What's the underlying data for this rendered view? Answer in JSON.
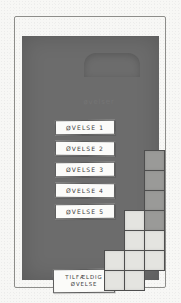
{
  "sketch": {
    "medium": "pencil-wireframe-on-paper",
    "paper_color": "#f7f7f5",
    "frame_border_color": "#8d8d8a"
  },
  "device": {
    "body_color": "#6c6c6c",
    "notch": {
      "name": "camera-bump",
      "shape": "rounded-tab"
    }
  },
  "screen": {
    "heading": "øvelser",
    "buttons": [
      {
        "label": "ØVELSE 1"
      },
      {
        "label": "ØVELSE 2"
      },
      {
        "label": "ØVELSE 3"
      },
      {
        "label": "ØVELSE 4"
      },
      {
        "label": "ØVELSE 5"
      }
    ],
    "random_button": {
      "line1": "TILFÆLDIG",
      "line2": "ØVELSE"
    },
    "button_fill": "#fbfbf9",
    "button_stroke": "#5d5d5d"
  },
  "tile_grid": {
    "cell_size": 21,
    "stroke": "#4e4e4e",
    "dark_fill": "#9a9a98",
    "light_fill": "#e4e4e0",
    "cells": [
      {
        "col": 2,
        "row": 0,
        "shade": "dark"
      },
      {
        "col": 2,
        "row": 1,
        "shade": "dark"
      },
      {
        "col": 2,
        "row": 2,
        "shade": "dark"
      },
      {
        "col": 2,
        "row": 3,
        "shade": "dark"
      },
      {
        "col": 1,
        "row": 3,
        "shade": "light"
      },
      {
        "col": 1,
        "row": 4,
        "shade": "light"
      },
      {
        "col": 2,
        "row": 4,
        "shade": "light"
      },
      {
        "col": 0,
        "row": 5,
        "shade": "light"
      },
      {
        "col": 1,
        "row": 5,
        "shade": "light"
      },
      {
        "col": 2,
        "row": 5,
        "shade": "light"
      },
      {
        "col": 0,
        "row": 6,
        "shade": "light"
      },
      {
        "col": 1,
        "row": 6,
        "shade": "light"
      }
    ]
  }
}
